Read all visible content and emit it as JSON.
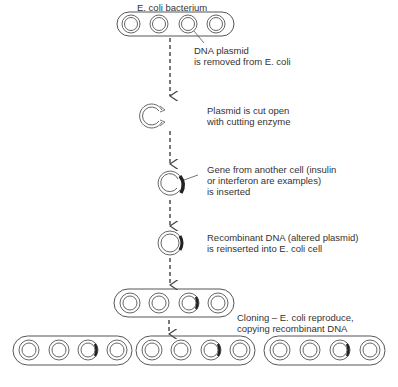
{
  "labels": {
    "bacterium": "E. coli bacterium",
    "step1_line1": "DNA plasmid",
    "step1_line2": "is removed from E. coli",
    "step2_line1": "Plasmid is cut open",
    "step2_line2": "with cutting enzyme",
    "step3_line1": "Gene from another cell (insulin",
    "step3_line2": "or interferon are examples)",
    "step3_line3": "is inserted",
    "step4_line1": "Recombinant DNA (altered plasmid)",
    "step4_line2": "is reinserted into E. coli cell",
    "step5_line1": "Cloning – E. coli reproduce,",
    "step5_line2": "copying recombinant DNA"
  },
  "colors": {
    "stroke": "#555555",
    "insert": "#333333",
    "text": "#333333"
  }
}
